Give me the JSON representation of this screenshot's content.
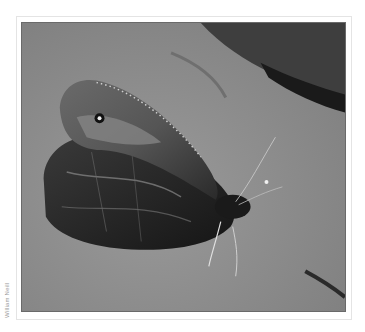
{
  "image": {
    "subject": "butterfly resting on rock (black and white photograph)",
    "credit": "William Neill"
  }
}
